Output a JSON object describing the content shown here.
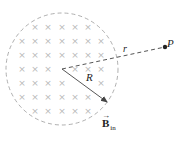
{
  "diagram": {
    "type": "magnetic-field-region",
    "circle": {
      "center": [
        62,
        69
      ],
      "radius": 56,
      "stroke": "#9a9a9a",
      "style": "dashed"
    },
    "field_marks": {
      "symbol": "×",
      "meaning": "field into page",
      "color": "#b8b8b8",
      "rows": [
        {
          "y": 27,
          "xs": [
            35,
            48,
            62,
            75,
            88
          ]
        },
        {
          "y": 41,
          "xs": [
            22,
            35,
            48,
            62,
            75,
            88,
            101
          ]
        },
        {
          "y": 55,
          "xs": [
            22,
            35,
            48,
            62,
            75,
            88,
            101
          ]
        },
        {
          "y": 69,
          "xs": [
            22,
            35,
            48,
            75,
            88,
            101
          ]
        },
        {
          "y": 83,
          "xs": [
            22,
            35,
            48,
            62,
            101
          ]
        },
        {
          "y": 97,
          "xs": [
            22,
            35,
            48,
            62,
            75,
            88
          ]
        },
        {
          "y": 111,
          "xs": [
            35,
            48,
            62,
            75,
            88
          ]
        }
      ]
    },
    "line_to_P": {
      "from": [
        62,
        69
      ],
      "to": [
        165,
        47
      ],
      "stroke": "#555555",
      "style": "dashed"
    },
    "radius_arrow": {
      "from": [
        62,
        69
      ],
      "to": [
        107,
        102
      ],
      "stroke": "#444444"
    },
    "point_P": {
      "position": [
        165,
        47
      ],
      "color": "#222222"
    },
    "labels": {
      "P": "P",
      "r": "r",
      "R": "R",
      "B_vector_symbol": "→",
      "B": "B",
      "B_subscript": "in"
    }
  }
}
